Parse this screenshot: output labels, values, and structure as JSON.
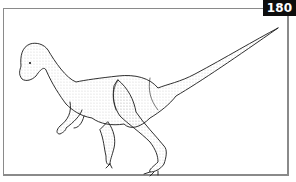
{
  "figure": {
    "page_number": "180",
    "illustration": "dinosaur-line-drawing",
    "colors": {
      "badge_bg": "#0d0d0d",
      "badge_text": "#ffffff",
      "frame_border": "#8a8a8a",
      "ink": "#1a1a1a"
    }
  }
}
